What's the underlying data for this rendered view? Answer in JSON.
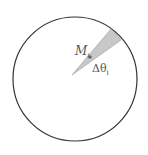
{
  "diagram": {
    "labels": {
      "mass": "M",
      "mass_sub": "i",
      "angle": "Δθ",
      "angle_sub": "i"
    },
    "colors": {
      "circle_stroke": "#333333",
      "wedge_fill": "#c8c8c8",
      "wedge_stroke": "#888888",
      "point": "#666666"
    }
  }
}
